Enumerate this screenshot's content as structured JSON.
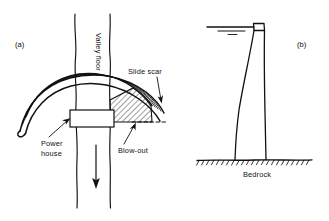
{
  "figure": {
    "background_color": "#ffffff",
    "ink_color": "#111111"
  },
  "panels": [
    {
      "id": "a",
      "label": "(a)",
      "view": "plan",
      "labels": {
        "valley_floor": "Valley floor",
        "slide_scar": "Slide scar",
        "power_house": "Power house",
        "power_house_line1": "Power",
        "power_house_line2": "house",
        "blow_out": "Blow-out"
      },
      "features": {
        "flow_arrow_direction": "down",
        "arch_band_count": 5,
        "blowout_hatching": "diagonal",
        "powerhouse_shape": "rectangle"
      }
    },
    {
      "id": "b",
      "label": "(b)",
      "view": "cross-section",
      "labels": {
        "bedrock": "Bedrock"
      },
      "features": {
        "water_surface_symbol": "double-line",
        "foundation_hatching": "ticks",
        "dam_profile": "curved-vertical"
      }
    }
  ]
}
